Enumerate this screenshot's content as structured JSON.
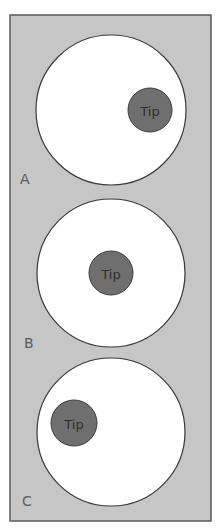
{
  "figure": {
    "colors": {
      "panel_fill": "#c6c6c6",
      "panel_border": "#5a5a5a",
      "outer_circle_fill": "#ffffff",
      "outer_circle_stroke": "#3a3a3a",
      "tip_fill": "#6f6f6f",
      "tip_stroke": "#3a3a3a",
      "tip_text": "#2e2e2e",
      "label_text": "#5a5a5a"
    },
    "panel": {
      "x": 10,
      "y": 15,
      "width": 201,
      "height": 506
    },
    "diagrams": [
      {
        "label": "A",
        "label_pos": {
          "x": 20,
          "y": 172
        },
        "outer_circle": {
          "cx": 111,
          "cy": 110,
          "r": 75
        },
        "tip": {
          "cx": 150,
          "cy": 110,
          "r": 22,
          "text": "Tip"
        }
      },
      {
        "label": "B",
        "label_pos": {
          "x": 24,
          "y": 336
        },
        "outer_circle": {
          "cx": 111,
          "cy": 273,
          "r": 74
        },
        "tip": {
          "cx": 111,
          "cy": 273,
          "r": 22,
          "text": "Tip"
        }
      },
      {
        "label": "C",
        "label_pos": {
          "x": 22,
          "y": 494
        },
        "outer_circle": {
          "cx": 111,
          "cy": 432,
          "r": 74
        },
        "tip": {
          "cx": 74,
          "cy": 423,
          "r": 23,
          "text": "Tip"
        }
      }
    ]
  }
}
